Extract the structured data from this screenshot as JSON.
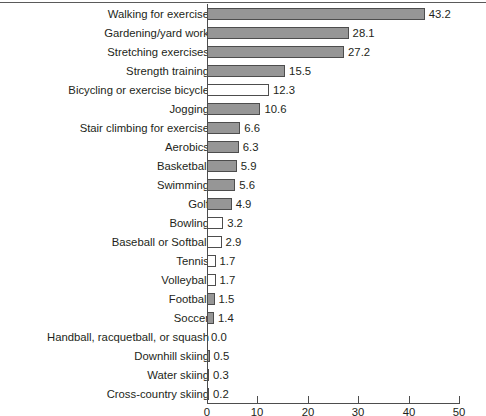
{
  "chart_data": {
    "type": "bar",
    "orientation": "horizontal",
    "title": "",
    "xlabel": "",
    "ylabel": "",
    "xlim": [
      0,
      50
    ],
    "xticks": [
      0,
      10,
      20,
      30,
      40,
      50
    ],
    "grid": false,
    "legend": false,
    "value_label_precision": 1,
    "colors": {
      "bar_fill": "#969696",
      "bar_fill_alt": "#ffffff",
      "bar_border": "#4d4d4d",
      "text": "#231f20",
      "axis": "#4d4d4d"
    },
    "categories": [
      "Walking for exercise",
      "Gardening/yard work",
      "Stretching exercises",
      "Strength training",
      "Bicycling or exercise bicycle",
      "Jogging",
      "Stair climbing for exercise",
      "Aerobics",
      "Basketball",
      "Swimming",
      "Golf",
      "Bowling",
      "Baseball or Softball",
      "Tennis",
      "Volleyball",
      "Football",
      "Soccer",
      "Handball, racquetball, or squash",
      "Downhill skiing",
      "Water skiing",
      "Cross-country skiing"
    ],
    "values": [
      43.2,
      28.1,
      27.2,
      15.5,
      12.3,
      10.6,
      6.6,
      6.3,
      5.9,
      5.6,
      4.9,
      3.2,
      2.9,
      1.7,
      1.7,
      1.5,
      1.4,
      0.0,
      0.5,
      0.3,
      0.2
    ],
    "value_labels": [
      "43.2",
      "28.1",
      "27.2",
      "15.5",
      "12.3",
      "10.6",
      "6.6",
      "6.3",
      "5.9",
      "5.6",
      "4.9",
      "3.2",
      "2.9",
      "1.7",
      "1.7",
      "1.5",
      "1.4",
      "0.0",
      "0.5",
      "0.3",
      "0.2"
    ],
    "bar_styles": [
      "filled",
      "filled",
      "filled",
      "filled",
      "hollow",
      "filled",
      "filled",
      "filled",
      "filled",
      "filled",
      "filled",
      "hollow",
      "hollow",
      "hollow",
      "hollow",
      "filled",
      "filled",
      "none",
      "filled",
      "filled",
      "filled"
    ],
    "xtick_labels": [
      "0",
      "10",
      "20",
      "30",
      "40",
      "50"
    ]
  }
}
